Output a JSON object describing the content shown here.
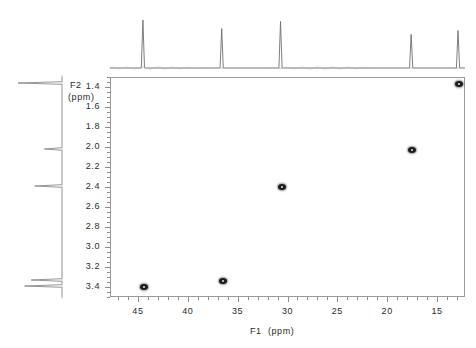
{
  "figure": {
    "type": "nmr-2d-correlation-spectrum",
    "background": "#ffffff",
    "frame_color": "#9a9a9a",
    "peak_color": "#1c1c1c",
    "trace_color": "#7a7a7a"
  },
  "axes": {
    "f2": {
      "title_line1": "F2",
      "title_line2": "(ppm)",
      "unit": "ppm",
      "nucleus": "1H",
      "direction": "top-to-bottom-increasing",
      "range": [
        1.3,
        3.5
      ],
      "ticks": [
        "1.4",
        "1.6",
        "1.8",
        "2.0",
        "2.2",
        "2.4",
        "2.6",
        "2.8",
        "3.0",
        "3.2",
        "3.4"
      ],
      "tick_values": [
        1.4,
        1.6,
        1.8,
        2.0,
        2.2,
        2.4,
        2.6,
        2.8,
        3.0,
        3.2,
        3.4
      ],
      "minor_tick_step": 0.05
    },
    "f1": {
      "title": "F1  (ppm)",
      "unit": "ppm",
      "nucleus": "13C",
      "direction": "left-to-right-decreasing",
      "range": [
        47.8,
        12.2
      ],
      "ticks": [
        "45",
        "40",
        "35",
        "30",
        "25",
        "20",
        "15"
      ],
      "tick_values": [
        45,
        40,
        35,
        30,
        25,
        20,
        15
      ],
      "minor_tick_step": 1
    }
  },
  "chart_data": {
    "type": "scatter",
    "title": "",
    "xlabel": "F1  (ppm)",
    "ylabel": "F2 (ppm)",
    "xlim": [
      47.8,
      12.2
    ],
    "ylim": [
      1.3,
      3.5
    ],
    "grid": false,
    "legend": "none",
    "x_inverted": true,
    "y_inverted": true,
    "series": [
      {
        "name": "HSQC cross peaks",
        "points": [
          {
            "f1": 44.5,
            "f2": 3.39,
            "label": "A"
          },
          {
            "f1": 36.6,
            "f2": 3.33,
            "label": "B"
          },
          {
            "f1": 30.7,
            "f2": 2.39,
            "label": "C"
          },
          {
            "f1": 17.6,
            "f2": 2.02,
            "label": "D"
          },
          {
            "f1": 12.9,
            "f2": 1.36,
            "label": "E"
          }
        ]
      }
    ],
    "projection_f1": {
      "name": "13C projection (top)",
      "peaks_ppm": [
        44.5,
        36.6,
        30.7,
        17.6,
        12.9
      ],
      "relative_heights": [
        1.0,
        0.82,
        0.97,
        0.7,
        0.78
      ]
    },
    "projection_f2": {
      "name": "1H projection (left)",
      "peaks_ppm": [
        1.36,
        2.02,
        2.39,
        3.33,
        3.39
      ],
      "relative_heights": [
        1.0,
        0.4,
        0.62,
        0.7,
        0.85
      ]
    }
  }
}
